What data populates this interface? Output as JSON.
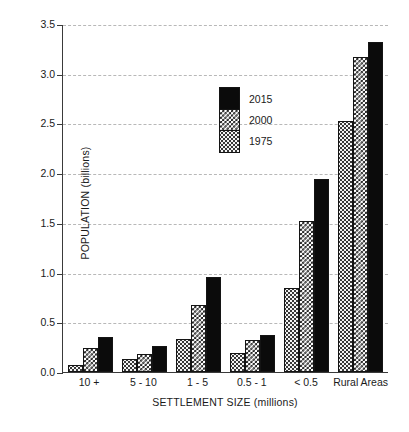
{
  "chart_data": {
    "type": "bar",
    "title": "",
    "xlabel": "SETTLEMENT SIZE (millions)",
    "ylabel": "POPULATION (billions)",
    "ylim": [
      0,
      3.5
    ],
    "yticks": [
      "0.0",
      "0.5",
      "1.0",
      "1.5",
      "2.0",
      "2.5",
      "3.0",
      "3.5"
    ],
    "ytick_values": [
      0,
      0.5,
      1.0,
      1.5,
      2.0,
      2.5,
      3.0,
      3.5
    ],
    "grid": "horizontal-dashed",
    "legend_position": "inside-upper-center",
    "categories": [
      "10 +",
      "5 - 10",
      "1 - 5",
      "0.5 - 1",
      "< 0.5",
      "Rural Areas"
    ],
    "series": [
      {
        "name": "1975",
        "pattern": "light-dotted",
        "values": [
          0.07,
          0.13,
          0.33,
          0.19,
          0.84,
          2.52
        ]
      },
      {
        "name": "2000",
        "pattern": "checkerboard",
        "values": [
          0.24,
          0.18,
          0.67,
          0.32,
          1.52,
          3.17
        ]
      },
      {
        "name": "2015",
        "pattern": "solid-black",
        "values": [
          0.35,
          0.26,
          0.96,
          0.37,
          1.94,
          3.32
        ]
      }
    ],
    "colors": {
      "axis": "#3a3a3a",
      "grid": "#b8b8b8",
      "bar_outline": "#141414",
      "series_2015": "#0b0b0b",
      "series_2000": "#1a1a1a",
      "series_1975": "#f4f4f4",
      "background": "#ffffff"
    }
  },
  "legend": {
    "entries": [
      "2015",
      "2000",
      "1975"
    ]
  }
}
